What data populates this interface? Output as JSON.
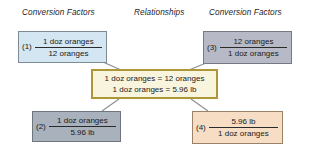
{
  "headings": {
    "left": "Conversion Factors",
    "center": "Relationships",
    "right": "Conversion Factors"
  },
  "boxes": [
    {
      "id": "1",
      "index_label": "(1)",
      "numerator": "1 doz oranges",
      "denominator": "12 oranges",
      "fill_color": "#d4e6f1",
      "border_color": "#7c8b96",
      "position": "top-left"
    },
    {
      "id": "2",
      "index_label": "(2)",
      "numerator": "1 doz oranges",
      "denominator": "5.96 lb",
      "fill_color": "#a9b2bc",
      "border_color": "#6e757d",
      "position": "bottom-left"
    },
    {
      "id": "3",
      "index_label": "(3)",
      "numerator": "12 oranges",
      "denominator": "1 doz oranges",
      "fill_color": "#b7bac6",
      "border_color": "#767a86",
      "position": "top-right"
    },
    {
      "id": "4",
      "index_label": "(4)",
      "numerator": "5.96 lb",
      "denominator": "1 doz oranges",
      "fill_color": "#f6ddc4",
      "border_color": "#9a8268",
      "position": "bottom-right"
    }
  ],
  "center_box": {
    "line1": "1 doz oranges = 12 oranges",
    "line2": "1 doz oranges = 5.96 lb",
    "fill_color": "#f9f4de",
    "border_color": "#ad9736"
  },
  "connectors": {
    "color": "#8a8d92",
    "count": 4
  },
  "background_color": "#ffffff"
}
